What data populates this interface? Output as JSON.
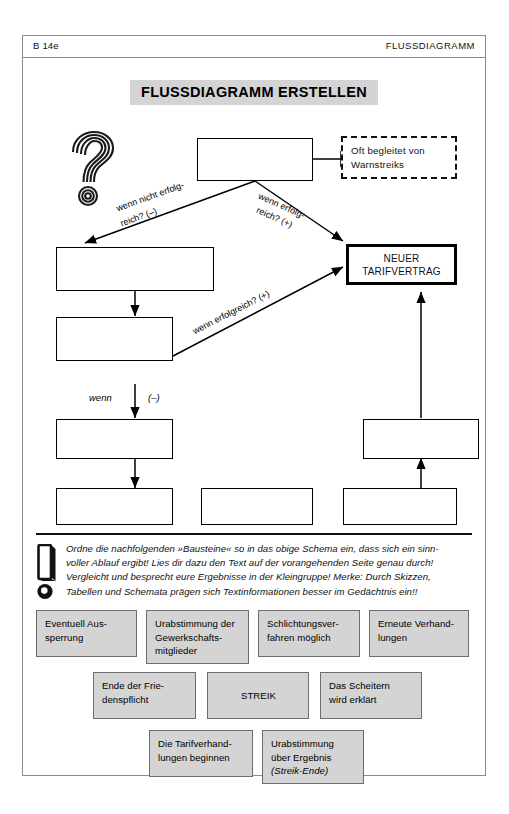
{
  "header": {
    "code": "B 14e",
    "section": "FLUSSDIAGRAMM"
  },
  "title": "FLUSSDIAGRAMM ERSTELLEN",
  "diagram": {
    "boxes": [
      {
        "id": "top-center",
        "label": ""
      },
      {
        "id": "note-dashed",
        "label": "Oft begleitet von Warnstreiks"
      },
      {
        "id": "left-upper",
        "label": ""
      },
      {
        "id": "result",
        "label": "NEUER TARIFVERTRAG"
      },
      {
        "id": "left-middle",
        "label": ""
      },
      {
        "id": "left-lower",
        "label": ""
      },
      {
        "id": "right-middle",
        "label": ""
      },
      {
        "id": "bottom-left",
        "label": ""
      },
      {
        "id": "bottom-center",
        "label": ""
      },
      {
        "id": "bottom-right",
        "label": ""
      }
    ],
    "edge_labels": {
      "negative_branch": "wenn nicht erfolg-\nreich? (–)",
      "negative_branch_l1": "wenn nicht erfolg-",
      "negative_branch_l2": "reich? (–)",
      "positive_branch_l1": "wenn erfolg-",
      "positive_branch_l2": "reich? (+)",
      "positive_lower": "wenn erfolgreich? (+)",
      "wenn_minus_word": "wenn",
      "wenn_minus_sign": "(–)"
    },
    "icons": {
      "question": "question-mark-icon"
    }
  },
  "instruction": {
    "icon": "exclamation-mark-icon",
    "line1": "Ordne die nachfolgenden »Bausteine« so in das obige Schema ein, dass sich ein sinn-",
    "line2": "voller Ablauf ergibt! Lies dir dazu den Text auf der vorangehenden Seite genau durch!",
    "line3": "Vergleicht und besprecht eure Ergebnisse in der Kleingruppe! Merke: Durch Skizzen,",
    "line4": "Tabellen und Schemata prägen sich Textinformationen besser im Gedächtnis ein!!"
  },
  "tiles": [
    {
      "id": "tile-aussperrung",
      "lines": [
        "Eventuell Aus-",
        "sperrung"
      ]
    },
    {
      "id": "tile-urabstimmung-gew",
      "lines": [
        "Urabstimmung der",
        "Gewerkschafts-",
        "mitglieder"
      ]
    },
    {
      "id": "tile-schlichtung",
      "lines": [
        "Schlichtungsver-",
        "fahren möglich"
      ]
    },
    {
      "id": "tile-erneute-verh",
      "lines": [
        "Erneute Verhand-",
        "lungen"
      ]
    },
    {
      "id": "tile-friedenspflicht",
      "lines": [
        "Ende der Frie-",
        "denspflicht"
      ]
    },
    {
      "id": "tile-streik",
      "lines": [
        "STREIK"
      ]
    },
    {
      "id": "tile-scheitern",
      "lines": [
        "Das Scheitern",
        "wird erklärt"
      ]
    },
    {
      "id": "tile-tarifverhandlungen",
      "lines": [
        "Die Tarifverhand-",
        "lungen beginnen"
      ]
    },
    {
      "id": "tile-urabstimmung-erg",
      "lines": [
        "Urabstimmung",
        "über Ergebnis"
      ],
      "italic_line": "(Streik-Ende)"
    }
  ],
  "colors": {
    "tile_fill": "#d4d4d4",
    "tile_border": "#6d6d6d",
    "title_fill": "#d4d4d4",
    "frame": "#8b8b8b",
    "ink": "#000000"
  }
}
